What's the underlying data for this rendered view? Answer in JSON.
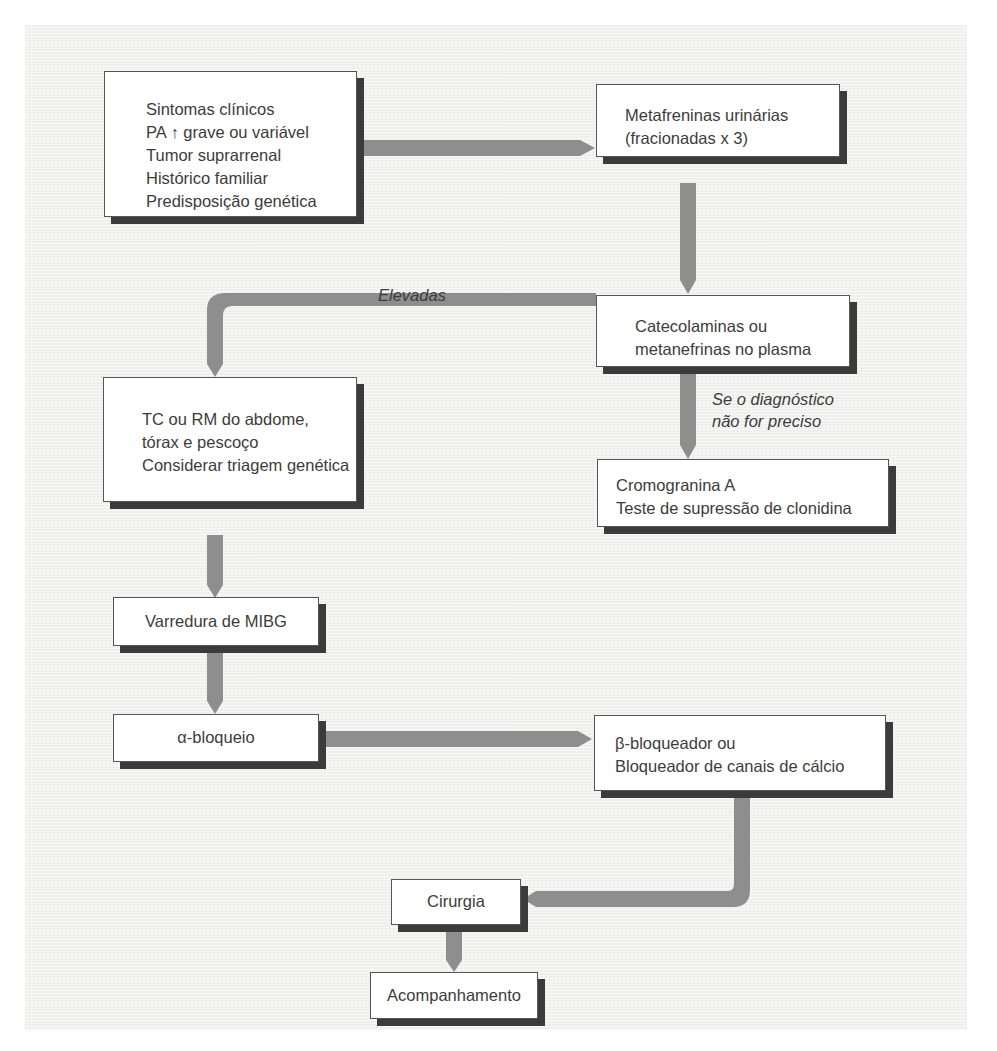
{
  "diagram": {
    "type": "flowchart",
    "colors": {
      "background_panel": "#f1f1f0",
      "box_fill": "#ffffff",
      "box_border": "#555555",
      "box_shadow": "#3b3b3b",
      "arrow": "#8e8e8e",
      "text": "#3c3c3c"
    },
    "nodes": {
      "inicio": {
        "lines": [
          "Sintomas clínicos",
          "PA ↑ grave ou variável",
          "Tumor suprarrenal",
          "Histórico familiar",
          "Predisposição genética"
        ]
      },
      "metanefrinas_urinarias": {
        "lines": [
          "Metafreninas urinárias",
          "(fracionadas x 3)"
        ]
      },
      "catecolaminas_plasma": {
        "lines": [
          "Catecolaminas ou",
          "metanefrinas no plasma"
        ]
      },
      "imagem": {
        "lines": [
          "TC ou RM do abdome,",
          "tórax e pescoço",
          "Considerar triagem genética"
        ]
      },
      "cromogranina": {
        "lines": [
          "Cromogranina A",
          "Teste de supressão de clonidina"
        ]
      },
      "mibg": {
        "lines": [
          "Varredura de MIBG"
        ]
      },
      "alfa_bloqueio": {
        "lines": [
          "α-bloqueio"
        ]
      },
      "beta_bloqueador": {
        "lines": [
          "β-bloqueador ou",
          "Bloqueador de canais de cálcio"
        ]
      },
      "cirurgia": {
        "lines": [
          "Cirurgia"
        ]
      },
      "acompanhamento": {
        "lines": [
          "Acompanhamento"
        ]
      }
    },
    "edge_labels": {
      "elevadas": "Elevadas",
      "nao_preciso": [
        "Se o diagnóstico",
        "não for preciso"
      ]
    },
    "edges": [
      {
        "from": "inicio",
        "to": "metanefrinas_urinarias"
      },
      {
        "from": "metanefrinas_urinarias",
        "to": "catecolaminas_plasma"
      },
      {
        "from": "catecolaminas_plasma",
        "to": "imagem",
        "label": "Elevadas"
      },
      {
        "from": "catecolaminas_plasma",
        "to": "cromogranina",
        "label": "Se o diagnóstico não for preciso"
      },
      {
        "from": "imagem",
        "to": "mibg"
      },
      {
        "from": "mibg",
        "to": "alfa_bloqueio"
      },
      {
        "from": "alfa_bloqueio",
        "to": "beta_bloqueador"
      },
      {
        "from": "beta_bloqueador",
        "to": "cirurgia"
      },
      {
        "from": "cirurgia",
        "to": "acompanhamento"
      }
    ]
  }
}
